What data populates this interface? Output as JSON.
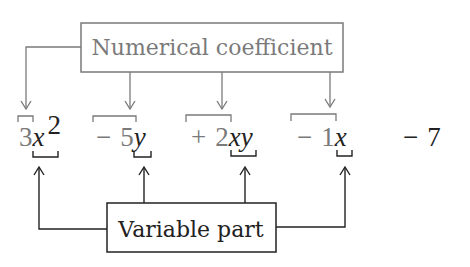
{
  "diagram": {
    "top_label": "Numerical coefficient",
    "bottom_label": "Variable part",
    "colors": {
      "coefficient": "#7a7a7a",
      "variable": "#222222"
    },
    "terms": [
      {
        "sign": "",
        "coefficient": "3",
        "variable": "x",
        "exponent": "2"
      },
      {
        "sign": "−",
        "coefficient": "5",
        "variable": "y",
        "exponent": ""
      },
      {
        "sign": "+",
        "coefficient": "2",
        "variable": "xy",
        "exponent": ""
      },
      {
        "sign": "−",
        "coefficient": "1",
        "variable": "x",
        "exponent": ""
      },
      {
        "sign": "−",
        "coefficient": "7",
        "variable": "",
        "exponent": ""
      }
    ],
    "t0": {
      "coef": "3",
      "var": "x",
      "exp": "2"
    },
    "t1": {
      "sign": "−",
      "coef": "5",
      "var": "y"
    },
    "t2": {
      "sign": "+",
      "coef": "2",
      "var": "xy"
    },
    "t3": {
      "sign": "−",
      "coef": "1",
      "var": "x"
    },
    "t4": {
      "sign": "−",
      "const": "7"
    }
  }
}
